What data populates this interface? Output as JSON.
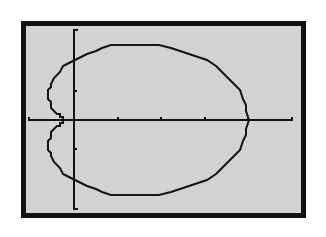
{
  "colors": {
    "page_background": "#ffffff",
    "frame": "#111111",
    "screen_background": "#d2d2d2",
    "ink": "#141414"
  },
  "chart_data": {
    "type": "line",
    "title": "",
    "xlabel": "",
    "ylabel": "",
    "polar_equation": {
      "a": 2.1,
      "b": 1.9
    },
    "theta_range": [
      0,
      6.2832
    ],
    "xlim": [
      -1.06,
      5.03
    ],
    "ylim": [
      -3.1,
      3.1
    ],
    "x_ticks": [
      1,
      2,
      3,
      4
    ],
    "y_ticks": [
      -1,
      1
    ],
    "grid": false,
    "legend": null,
    "key_points": [
      {
        "label": "right x-intercept",
        "x": 4.0,
        "y": 0
      },
      {
        "label": "left x-intercept (dimple)",
        "x": -0.2,
        "y": 0
      },
      {
        "label": "upper y-intercept",
        "x": 0,
        "y": 2.1
      },
      {
        "label": "lower y-intercept",
        "x": 0,
        "y": -2.1
      },
      {
        "label": "top",
        "x": 1.8,
        "y": 2.7
      },
      {
        "label": "bottom",
        "x": 1.8,
        "y": -2.7
      }
    ]
  }
}
